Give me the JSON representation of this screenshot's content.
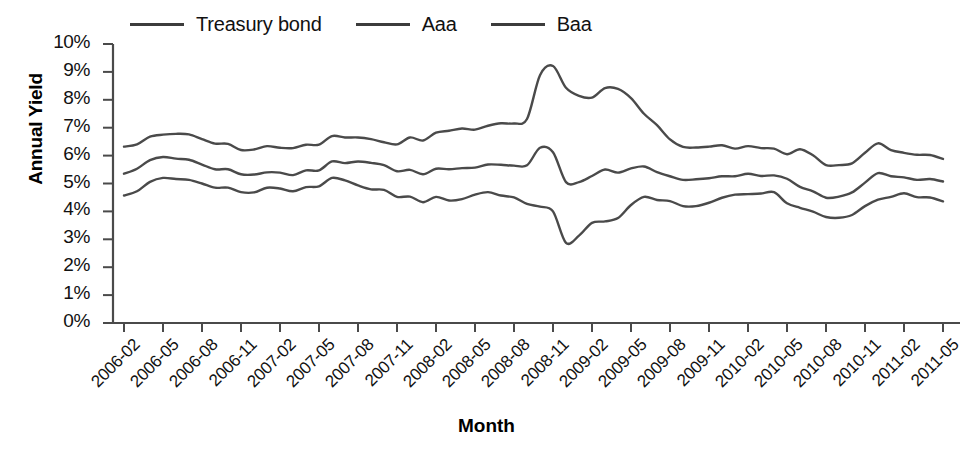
{
  "chart_data": {
    "type": "line",
    "title": "",
    "xlabel": "Month",
    "ylabel": "Annual Yield",
    "ylim": [
      0,
      10
    ],
    "yticks": [
      "0%",
      "1%",
      "2%",
      "3%",
      "4%",
      "5%",
      "6%",
      "7%",
      "8%",
      "9%",
      "10%"
    ],
    "grid": false,
    "legend_position": "top",
    "x": [
      "2006-02",
      "2006-03",
      "2006-04",
      "2006-05",
      "2006-06",
      "2006-07",
      "2006-08",
      "2006-09",
      "2006-10",
      "2006-11",
      "2006-12",
      "2007-01",
      "2007-02",
      "2007-03",
      "2007-04",
      "2007-05",
      "2007-06",
      "2007-07",
      "2007-08",
      "2007-09",
      "2007-10",
      "2007-11",
      "2007-12",
      "2008-01",
      "2008-02",
      "2008-03",
      "2008-04",
      "2008-05",
      "2008-06",
      "2008-07",
      "2008-08",
      "2008-09",
      "2008-10",
      "2008-11",
      "2008-12",
      "2009-01",
      "2009-02",
      "2009-03",
      "2009-04",
      "2009-05",
      "2009-06",
      "2009-07",
      "2009-08",
      "2009-09",
      "2009-10",
      "2009-11",
      "2009-12",
      "2010-01",
      "2010-02",
      "2010-03",
      "2010-04",
      "2010-05",
      "2010-06",
      "2010-07",
      "2010-08",
      "2010-09",
      "2010-10",
      "2010-11",
      "2010-12",
      "2011-01",
      "2011-02",
      "2011-03",
      "2011-04",
      "2011-05"
    ],
    "xticks": [
      "2006-02",
      "2006-05",
      "2006-08",
      "2006-11",
      "2007-02",
      "2007-05",
      "2007-08",
      "2007-11",
      "2008-02",
      "2008-05",
      "2008-08",
      "2008-11",
      "2009-02",
      "2009-05",
      "2009-08",
      "2009-11",
      "2010-02",
      "2010-05",
      "2010-08",
      "2010-11",
      "2011-02",
      "2011-05"
    ],
    "series": [
      {
        "name": "Treasury bond",
        "color": "#4a4a4a",
        "values": [
          4.57,
          4.72,
          5.06,
          5.2,
          5.16,
          5.13,
          5.0,
          4.85,
          4.85,
          4.69,
          4.68,
          4.85,
          4.82,
          4.72,
          4.87,
          4.9,
          5.2,
          5.11,
          4.93,
          4.79,
          4.77,
          4.52,
          4.53,
          4.33,
          4.52,
          4.39,
          4.44,
          4.6,
          4.69,
          4.57,
          4.5,
          4.27,
          4.17,
          4.0,
          2.87,
          3.13,
          3.59,
          3.64,
          3.76,
          4.23,
          4.52,
          4.41,
          4.37,
          4.19,
          4.19,
          4.31,
          4.49,
          4.6,
          4.62,
          4.64,
          4.69,
          4.29,
          4.13,
          3.99,
          3.8,
          3.77,
          3.87,
          4.19,
          4.42,
          4.52,
          4.65,
          4.51,
          4.5,
          4.36
        ]
      },
      {
        "name": "Aaa",
        "color": "#4a4a4a",
        "values": [
          5.35,
          5.53,
          5.84,
          5.95,
          5.89,
          5.85,
          5.68,
          5.51,
          5.51,
          5.33,
          5.32,
          5.4,
          5.39,
          5.3,
          5.47,
          5.47,
          5.79,
          5.73,
          5.79,
          5.74,
          5.66,
          5.44,
          5.49,
          5.33,
          5.53,
          5.51,
          5.55,
          5.57,
          5.68,
          5.67,
          5.64,
          5.65,
          6.28,
          6.12,
          5.05,
          5.05,
          5.27,
          5.5,
          5.39,
          5.54,
          5.61,
          5.41,
          5.26,
          5.13,
          5.15,
          5.19,
          5.26,
          5.26,
          5.35,
          5.27,
          5.29,
          5.17,
          4.88,
          4.72,
          4.49,
          4.53,
          4.68,
          5.03,
          5.37,
          5.26,
          5.22,
          5.13,
          5.16,
          5.07
        ]
      },
      {
        "name": "Baa",
        "color": "#4a4a4a",
        "values": [
          6.32,
          6.4,
          6.68,
          6.75,
          6.78,
          6.76,
          6.59,
          6.43,
          6.42,
          6.2,
          6.22,
          6.34,
          6.28,
          6.27,
          6.39,
          6.39,
          6.7,
          6.65,
          6.65,
          6.59,
          6.48,
          6.4,
          6.65,
          6.54,
          6.82,
          6.89,
          6.97,
          6.93,
          7.07,
          7.16,
          7.15,
          7.31,
          8.88,
          9.21,
          8.43,
          8.14,
          8.08,
          8.42,
          8.39,
          8.06,
          7.5,
          7.09,
          6.58,
          6.31,
          6.29,
          6.32,
          6.37,
          6.25,
          6.34,
          6.27,
          6.25,
          6.05,
          6.23,
          6.01,
          5.66,
          5.66,
          5.72,
          6.1,
          6.44,
          6.2,
          6.1,
          6.03,
          6.02,
          5.88
        ]
      }
    ]
  },
  "axis": {
    "y_title": "Annual Yield",
    "x_title": "Month"
  }
}
